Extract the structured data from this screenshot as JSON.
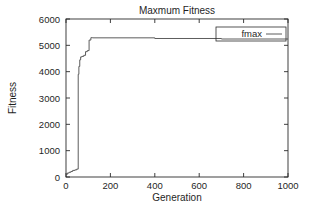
{
  "chart_data": {
    "type": "line",
    "title": "Maxmum Fitness",
    "xlabel": "Generation",
    "ylabel": "Fitness",
    "xlim": [
      0,
      1000
    ],
    "ylim": [
      0,
      6000
    ],
    "xticks": [
      0,
      200,
      400,
      600,
      800,
      1000
    ],
    "yticks": [
      0,
      1000,
      2000,
      3000,
      4000,
      5000,
      6000
    ],
    "xtick_labels": [
      "0",
      "200",
      "400",
      "600",
      "800",
      "1000"
    ],
    "ytick_labels": [
      "0",
      "1000",
      "2000",
      "3000",
      "4000",
      "5000",
      "6000"
    ],
    "grid": false,
    "legend_position": "top-right",
    "legend_entries": [
      "fmax"
    ],
    "series": [
      {
        "name": "fmax",
        "color": "#4a4a4a",
        "style": "step",
        "x": [
          0,
          6,
          6,
          14,
          14,
          22,
          22,
          30,
          30,
          40,
          40,
          48,
          48,
          55,
          55,
          58,
          58,
          62,
          62,
          66,
          66,
          72,
          72,
          80,
          80,
          88,
          88,
          96,
          96,
          104,
          104,
          112,
          112,
          120,
          120,
          400,
          400,
          700,
          700,
          1000
        ],
        "y": [
          100,
          100,
          150,
          150,
          180,
          180,
          210,
          210,
          250,
          250,
          270,
          270,
          300,
          300,
          3900,
          3900,
          4200,
          4200,
          4450,
          4450,
          4560,
          4560,
          4580,
          4580,
          4620,
          4620,
          4760,
          4760,
          4800,
          4800,
          5200,
          5200,
          5290,
          5290,
          5285,
          5285,
          5260,
          5260,
          5240,
          5240
        ]
      }
    ]
  },
  "figure": {
    "background_color": "#ffffff",
    "axis_color": "#2b2b2b",
    "text_color": "#1f1f1f"
  }
}
